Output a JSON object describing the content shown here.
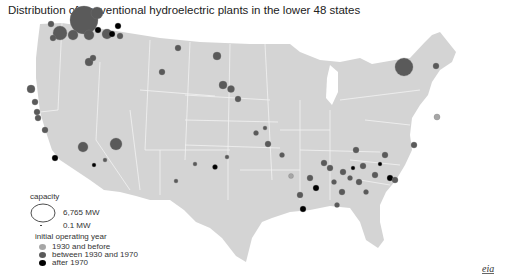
{
  "title": "Distribution of conventional hydroelectric plants in the lower 48 states",
  "legend": {
    "capacity_label": "capacity",
    "capacity_max": "6,765 MW",
    "capacity_min": "0.1 MW",
    "year_label": "initial operating year",
    "categories": [
      {
        "label": "1930 and before",
        "color": "#a6a6a6"
      },
      {
        "label": "between 1930 and 1970",
        "color": "#5a5a5a"
      },
      {
        "label": "after 1970",
        "color": "#000000"
      }
    ]
  },
  "colors": {
    "land": "#d4d4d4",
    "borders": "#f0f0f0",
    "background": "#ffffff"
  },
  "logo": "eia"
}
